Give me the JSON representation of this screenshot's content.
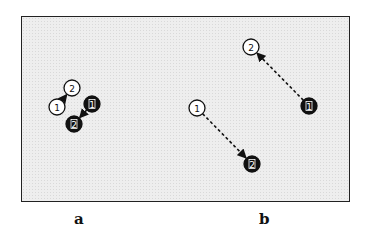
{
  "figure": {
    "panels": [
      {
        "label": "a",
        "nodes": [
          {
            "id": "a-white-1",
            "text": "1",
            "fill": "white",
            "cx": 57,
            "cy": 107
          },
          {
            "id": "a-white-2",
            "text": "2",
            "fill": "white",
            "cx": 72,
            "cy": 88
          },
          {
            "id": "a-black-1",
            "text": "1",
            "fill": "black",
            "cx": 92,
            "cy": 104
          },
          {
            "id": "a-black-2",
            "text": "2",
            "fill": "black",
            "cx": 74,
            "cy": 124
          }
        ],
        "arrows": [
          {
            "from": "a-white-1",
            "to": "a-white-2",
            "style": "solid"
          },
          {
            "from": "a-black-1",
            "to": "a-black-2",
            "style": "solid"
          }
        ]
      },
      {
        "label": "b",
        "nodes": [
          {
            "id": "b-white-1",
            "text": "1",
            "fill": "white",
            "cx": 197,
            "cy": 108
          },
          {
            "id": "b-black-2",
            "text": "2",
            "fill": "black",
            "cx": 252,
            "cy": 164
          },
          {
            "id": "b-white-2",
            "text": "2",
            "fill": "white",
            "cx": 251,
            "cy": 47
          },
          {
            "id": "b-black-1",
            "text": "1",
            "fill": "black",
            "cx": 309,
            "cy": 106
          }
        ],
        "arrows": [
          {
            "from": "b-white-1",
            "to": "b-black-2",
            "style": "dashed"
          },
          {
            "from": "b-black-1",
            "to": "b-white-2",
            "style": "dashed"
          }
        ]
      }
    ],
    "colors": {
      "background": "#eeeeee",
      "border": "#222222",
      "node_black": "#111111",
      "node_white": "#ffffff"
    }
  },
  "labels": {
    "a": "a",
    "b": "b"
  }
}
